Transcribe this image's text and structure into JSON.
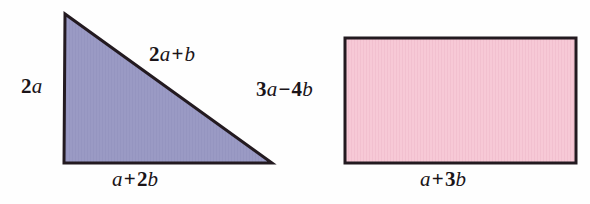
{
  "figure": {
    "background_color": "#fefefe",
    "stroke_color": "#231a20",
    "text_color": "#1a1418"
  },
  "shapes": [
    {
      "id": "triangle",
      "kind": "right-triangle",
      "fill_color": "#9a9ac4",
      "stroke_color": "#231a20",
      "points": "65,14 64,163 272,163",
      "labels": {
        "left": {
          "parts": [
            {
              "t": "2",
              "k": "num"
            },
            {
              "t": "a",
              "k": "var"
            }
          ],
          "text": "2a"
        },
        "hypotenuse": {
          "parts": [
            {
              "t": "2",
              "k": "num"
            },
            {
              "t": "a",
              "k": "var"
            },
            {
              "t": "+",
              "k": "op"
            },
            {
              "t": "b",
              "k": "var"
            }
          ],
          "text": "2a + b"
        },
        "base": {
          "parts": [
            {
              "t": "a",
              "k": "var"
            },
            {
              "t": "+",
              "k": "op"
            },
            {
              "t": "2",
              "k": "num"
            },
            {
              "t": "b",
              "k": "var"
            }
          ],
          "text": "a + 2b"
        }
      }
    },
    {
      "id": "rectangle",
      "kind": "rectangle",
      "fill_color": "#f7c9d6",
      "stroke_color": "#231a20",
      "x": 345,
      "y": 38,
      "width": 231,
      "height": 125,
      "labels": {
        "left": {
          "parts": [
            {
              "t": "3",
              "k": "num"
            },
            {
              "t": "a",
              "k": "var"
            },
            {
              "t": "−",
              "k": "op"
            },
            {
              "t": "4",
              "k": "num"
            },
            {
              "t": "b",
              "k": "var"
            }
          ],
          "text": "3a − 4b"
        },
        "bottom": {
          "parts": [
            {
              "t": "a",
              "k": "var"
            },
            {
              "t": "+",
              "k": "op"
            },
            {
              "t": "3",
              "k": "num"
            },
            {
              "t": "b",
              "k": "var"
            }
          ],
          "text": "a + 3b"
        }
      }
    }
  ]
}
